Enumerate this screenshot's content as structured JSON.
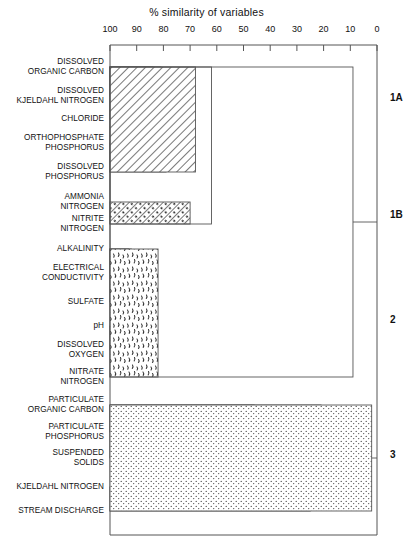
{
  "axis": {
    "title": "% similarity of variables",
    "ticks": [
      100,
      90,
      80,
      70,
      60,
      50,
      40,
      30,
      20,
      10,
      0
    ],
    "min": 0,
    "max": 100,
    "left_px": 110,
    "right_px": 377
  },
  "variables": [
    {
      "id": "doc",
      "lines": [
        "DISSOLVED",
        "ORGANIC CARBON"
      ],
      "y": 67
    },
    {
      "id": "dkn",
      "lines": [
        "DISSOLVED",
        "KJELDAHL NITROGEN"
      ],
      "y": 96
    },
    {
      "id": "cl",
      "lines": [
        "CHLORIDE"
      ],
      "y": 119
    },
    {
      "id": "op",
      "lines": [
        "ORTHOPHOSPHATE",
        "PHOSPHORUS"
      ],
      "y": 143
    },
    {
      "id": "dp",
      "lines": [
        "DISSOLVED",
        "PHOSPHORUS"
      ],
      "y": 172
    },
    {
      "id": "nh3",
      "lines": [
        "AMMONIA",
        "NITROGEN"
      ],
      "y": 202
    },
    {
      "id": "no2",
      "lines": [
        "NITRITE",
        "NITROGEN"
      ],
      "y": 224
    },
    {
      "id": "alk",
      "lines": [
        "ALKALINITY"
      ],
      "y": 249
    },
    {
      "id": "ec",
      "lines": [
        "ELECTRICAL",
        "CONDUCTIVITY"
      ],
      "y": 273
    },
    {
      "id": "so4",
      "lines": [
        "SULFATE"
      ],
      "y": 302
    },
    {
      "id": "ph",
      "lines": [
        "pH"
      ],
      "y": 326
    },
    {
      "id": "do",
      "lines": [
        "DISSOLVED",
        "OXYGEN"
      ],
      "y": 350
    },
    {
      "id": "no3",
      "lines": [
        "NITRATE",
        "NITROGEN"
      ],
      "y": 377
    },
    {
      "id": "poc",
      "lines": [
        "PARTICULATE",
        "ORGANIC CARBON"
      ],
      "y": 405
    },
    {
      "id": "pp",
      "lines": [
        "PARTICULATE",
        "PHOSPHORUS"
      ],
      "y": 432
    },
    {
      "id": "ss",
      "lines": [
        "SUSPENDED",
        "SOLIDS"
      ],
      "y": 458
    },
    {
      "id": "kn",
      "lines": [
        "KJELDAHL NITROGEN"
      ],
      "y": 487
    },
    {
      "id": "sd",
      "lines": [
        "STREAM DISCHARGE"
      ],
      "y": 511
    }
  ],
  "cluster_labels": [
    {
      "text": "1A",
      "y": 98,
      "x": 390
    },
    {
      "text": "1B",
      "y": 215,
      "x": 390
    },
    {
      "text": "2",
      "y": 320,
      "x": 390
    },
    {
      "text": "3",
      "y": 455,
      "x": 390
    }
  ],
  "chart_data": {
    "type": "dendrogram",
    "title": "% similarity of variables",
    "xlabel": "% similarity of variables",
    "ylabel": "",
    "xlim": [
      100,
      0
    ],
    "x_reversed": true,
    "leaves": [
      "DISSOLVED ORGANIC CARBON",
      "DISSOLVED KJELDAHL NITROGEN",
      "CHLORIDE",
      "ORTHOPHOSPHATE PHOSPHORUS",
      "DISSOLVED PHOSPHORUS",
      "AMMONIA NITROGEN",
      "NITRITE NITROGEN",
      "ALKALINITY",
      "ELECTRICAL CONDUCTIVITY",
      "SULFATE",
      "pH",
      "DISSOLVED OXYGEN",
      "NITRATE NITROGEN",
      "PARTICULATE ORGANIC CARBON",
      "PARTICULATE PHOSPHORUS",
      "SUSPENDED SOLIDS",
      "KJELDAHL NITROGEN",
      "STREAM DISCHARGE"
    ],
    "clusters": [
      "1A",
      "1B",
      "2",
      "3"
    ],
    "merges": [
      {
        "label": "DOC + DKN",
        "similarity": 84,
        "members": [
          "doc",
          "dkn"
        ]
      },
      {
        "label": "(DOC,DKN) + CHLORIDE",
        "similarity": 81,
        "members": [
          "doc",
          "dkn",
          "cl"
        ]
      },
      {
        "label": "ORTHO-P + DISSOLVED-P",
        "similarity": 79,
        "members": [
          "op",
          "dp"
        ]
      },
      {
        "label": "cluster 1A",
        "similarity": 68,
        "members": [
          "doc",
          "dkn",
          "cl",
          "op",
          "dp"
        ]
      },
      {
        "label": "AMMONIA-N + NITRITE-N (1B)",
        "similarity": 70,
        "members": [
          "nh3",
          "no2"
        ]
      },
      {
        "label": "cluster 1A + 1B",
        "similarity": 62,
        "members": [
          "doc",
          "dkn",
          "cl",
          "op",
          "dp",
          "nh3",
          "no2"
        ]
      },
      {
        "label": "ALKALINITY + EL. CONDUCTIVITY",
        "similarity": 93,
        "members": [
          "alk",
          "ec"
        ]
      },
      {
        "label": "(ALK,EC) + SULFATE",
        "similarity": 92,
        "members": [
          "alk",
          "ec",
          "so4"
        ]
      },
      {
        "label": "pH + DISSOLVED OXYGEN",
        "similarity": 89,
        "members": [
          "ph",
          "do"
        ]
      },
      {
        "label": "cluster 2",
        "similarity": 82,
        "members": [
          "alk",
          "ec",
          "so4",
          "ph",
          "do",
          "no3"
        ]
      },
      {
        "label": "POC + PARTICULATE-P",
        "similarity": 46,
        "members": [
          "poc",
          "pp"
        ]
      },
      {
        "label": "(POC,PP) + SUSPENDED SOLIDS",
        "similarity": 21,
        "members": [
          "poc",
          "pp",
          "ss"
        ]
      },
      {
        "label": "KJELDAHL-N + STREAM DISCHARGE",
        "similarity": 5,
        "members": [
          "kn",
          "sd"
        ]
      },
      {
        "label": "cluster 3",
        "similarity": 0,
        "members": [
          "poc",
          "pp",
          "ss",
          "kn",
          "sd"
        ]
      },
      {
        "label": "cluster 1 + cluster 2",
        "similarity": 9,
        "members": [
          "cluster1",
          "cluster2"
        ]
      }
    ],
    "fill_patterns": {
      "cluster_1A": "diagonal-hatch",
      "cluster_1B": "diagonal-hatch-dots",
      "cluster_2": "squiggle-stipple",
      "cluster_3": "fine-dot-stipple",
      "root": "none"
    },
    "grid": false,
    "legend": "none"
  }
}
